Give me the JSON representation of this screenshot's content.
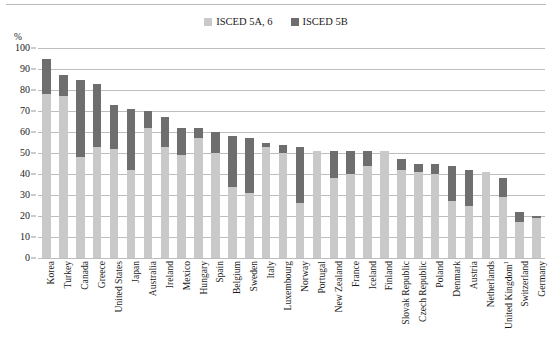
{
  "axis": {
    "unit_label": "%",
    "y_ticks": [
      0,
      10,
      20,
      30,
      40,
      50,
      60,
      70,
      80,
      90,
      100
    ]
  },
  "legend": {
    "items": [
      {
        "label": "ISCED 5A, 6",
        "color": "#c9c9c9",
        "swatch_name": "isced-5a-6-swatch"
      },
      {
        "label": "ISCED 5B",
        "color": "#6e6e6e",
        "swatch_name": "isced-5b-swatch"
      }
    ]
  },
  "chart_data": {
    "type": "bar",
    "title": "",
    "xlabel": "",
    "ylabel": "%",
    "ylim": [
      0,
      100
    ],
    "grid": true,
    "stacked": true,
    "legend_position": "top-center",
    "categories": [
      "Korea",
      "Turkey",
      "Canada",
      "Greece",
      "United States",
      "Japan",
      "Australia",
      "Ireland",
      "Mexico",
      "Hungary",
      "Spain",
      "Belgium",
      "Sweden",
      "Italy",
      "Luxembourg",
      "Norway",
      "Portugal",
      "New Zealand",
      "France",
      "Iceland",
      "Finland",
      "Slovak Republic",
      "Czech Republic",
      "Poland",
      "Denmark",
      "Austria",
      "Netherlands",
      "United Kingdom¹",
      "Switzerland",
      "Germany"
    ],
    "series": [
      {
        "name": "ISCED 5A, 6",
        "color": "#c9c9c9",
        "values": [
          78,
          77,
          48,
          53,
          52,
          42,
          62,
          53,
          49,
          57,
          50,
          34,
          31,
          53,
          50,
          26,
          51,
          38,
          40,
          44,
          51,
          42,
          41,
          40,
          27,
          25,
          41,
          29,
          17,
          19
        ]
      },
      {
        "name": "ISCED 5B",
        "color": "#6e6e6e",
        "values": [
          17,
          10,
          37,
          30,
          21,
          29,
          8,
          14,
          13,
          5,
          10,
          24,
          26,
          2,
          4,
          27,
          0,
          13,
          11,
          7,
          0,
          5,
          4,
          5,
          17,
          17,
          0,
          9,
          5,
          1
        ]
      }
    ],
    "totals": [
      95,
      87,
      85,
      83,
      73,
      71,
      70,
      67,
      62,
      62,
      60,
      58,
      57,
      55,
      54,
      53,
      51,
      51,
      51,
      51,
      51,
      47,
      45,
      45,
      44,
      42,
      41,
      38,
      22,
      20
    ]
  }
}
